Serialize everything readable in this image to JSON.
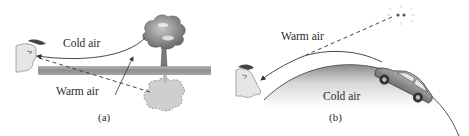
{
  "panels": [
    {
      "id": "a",
      "caption": "(a)",
      "labels": {
        "upper": "Cold air",
        "lower": "Warm air"
      },
      "elements": [
        "observer-head",
        "ground-strip",
        "tree",
        "tree-mirage-reflection",
        "direct-ray",
        "refracted-dashed-ray",
        "warm-air-pointer-arrow"
      ]
    },
    {
      "id": "b",
      "caption": "(b)",
      "labels": {
        "upper": "Warm air",
        "lower": "Cold air"
      },
      "elements": [
        "observer-head",
        "curved-hill",
        "car",
        "car-headlights",
        "curved-ray",
        "dashed-apparent-ray"
      ]
    }
  ],
  "colors": {
    "line": "#333333",
    "ground": "#9a9a9a",
    "foliage": "#8c8c8c",
    "reflection": "#c8c8c8",
    "hill_edge": "#6a6a6a",
    "face": "#e4e4e4"
  }
}
